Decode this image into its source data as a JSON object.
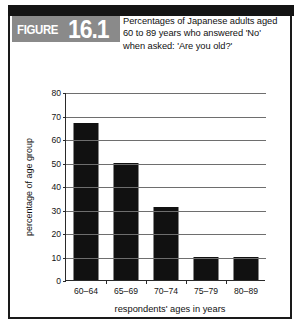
{
  "figure": {
    "tag_word": "FIGURE",
    "tag_number": "16.1",
    "title_lines": [
      "Percentages of Japanese adults aged",
      "60 to 89 years who answered 'No'",
      "when asked: 'Are you old?'"
    ]
  },
  "colors": {
    "bar": "#111111",
    "tag_background": "#8a8a8a",
    "header_band": "#141414",
    "gridline": "#6e6e6e",
    "border": "#1a1a1a"
  },
  "chart_data": {
    "type": "bar",
    "title": "Percentages of Japanese adults aged 60 to 89 years who answered 'No' when asked: 'Are you old?'",
    "categories": [
      "60–64",
      "65–69",
      "70–74",
      "75–79",
      "80–89"
    ],
    "values": [
      67,
      50,
      31,
      10,
      10
    ],
    "xlabel": "respondents' ages in years",
    "ylabel": "percentage of age group",
    "ylim": [
      0,
      80
    ],
    "yticks": [
      0,
      10,
      20,
      30,
      40,
      50,
      60,
      70,
      80
    ],
    "ytick_labels": [
      "0",
      "10",
      "20",
      "30",
      "40",
      "50",
      "60",
      "70",
      "80"
    ],
    "grid": true,
    "legend": "none",
    "series": [
      {
        "name": "percentage answering 'No'",
        "values": [
          67,
          50,
          31,
          10,
          10
        ]
      }
    ]
  }
}
